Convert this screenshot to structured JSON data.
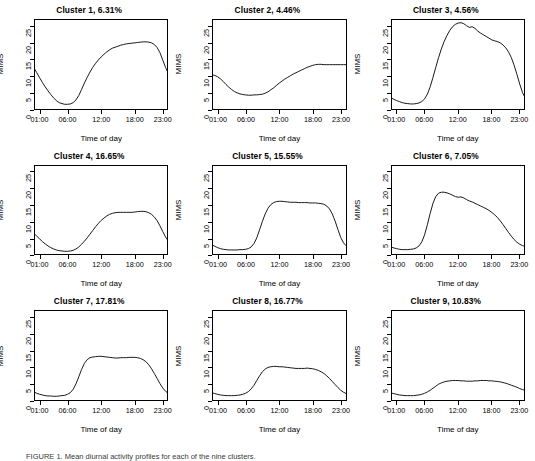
{
  "figure": {
    "axis_labels": {
      "x": "Time of day",
      "y": "MIMS"
    },
    "caption_prefix": "FIGURE 1",
    "caption_text": "FIGURE 1. Mean diurnal activity profiles for each of the nine clusters."
  },
  "chart_data": {
    "type": "line",
    "xlabel": "Time of day",
    "ylabel": "MIMS",
    "xlim": [
      0,
      24
    ],
    "ylim": [
      0,
      27
    ],
    "grid": false,
    "legend": "none",
    "xticks": [
      {
        "value": 1,
        "label": "01:00"
      },
      {
        "value": 6,
        "label": "06:00"
      },
      {
        "value": 12,
        "label": "12:00"
      },
      {
        "value": 18,
        "label": "18:00"
      },
      {
        "value": 23,
        "label": "23:00"
      }
    ],
    "yticks": [
      {
        "value": 0,
        "label": "0"
      },
      {
        "value": 5,
        "label": "5"
      },
      {
        "value": 10,
        "label": "10"
      },
      {
        "value": 15,
        "label": "15"
      },
      {
        "value": 20,
        "label": "20"
      },
      {
        "value": 25,
        "label": "25"
      }
    ],
    "x": [
      0,
      0.5,
      1,
      1.5,
      2,
      2.5,
      3,
      3.5,
      4,
      4.5,
      5,
      5.5,
      6,
      6.5,
      7,
      7.5,
      8,
      8.5,
      9,
      9.5,
      10,
      10.5,
      11,
      11.5,
      12,
      12.5,
      13,
      13.5,
      14,
      14.5,
      15,
      15.5,
      16,
      16.5,
      17,
      17.5,
      18,
      18.5,
      19,
      19.5,
      20,
      20.5,
      21,
      21.5,
      22,
      22.5,
      23,
      23.5,
      24
    ],
    "panels": [
      {
        "id": "cluster-1",
        "title": "Cluster 1, 6.31%",
        "cluster": 1,
        "percent": 6.31,
        "values": [
          12.4,
          11.0,
          9.5,
          8.1,
          6.8,
          5.6,
          4.5,
          3.5,
          2.7,
          2.1,
          1.8,
          1.6,
          1.6,
          1.7,
          2.1,
          2.9,
          4.2,
          6.0,
          7.9,
          9.6,
          11.2,
          12.6,
          13.8,
          14.8,
          15.7,
          16.5,
          17.2,
          17.8,
          18.3,
          18.6,
          18.9,
          19.2,
          19.4,
          19.6,
          19.7,
          19.8,
          19.9,
          20.0,
          20.1,
          20.2,
          20.2,
          20.1,
          19.9,
          19.4,
          18.5,
          17.0,
          14.8,
          12.6,
          10.9
        ]
      },
      {
        "id": "cluster-2",
        "title": "Cluster 2, 4.46%",
        "cluster": 2,
        "percent": 4.46,
        "values": [
          10.4,
          10.2,
          9.8,
          9.2,
          8.4,
          7.5,
          6.7,
          6.0,
          5.4,
          5.0,
          4.7,
          4.5,
          4.4,
          4.3,
          4.3,
          4.4,
          4.4,
          4.5,
          4.6,
          4.9,
          5.3,
          5.9,
          6.5,
          7.2,
          7.9,
          8.5,
          9.1,
          9.6,
          10.1,
          10.6,
          11.0,
          11.4,
          11.8,
          12.2,
          12.6,
          12.9,
          13.2,
          13.4,
          13.5,
          13.5,
          13.4,
          13.4,
          13.4,
          13.4,
          13.4,
          13.4,
          13.4,
          13.4,
          13.4
        ]
      },
      {
        "id": "cluster-3",
        "title": "Cluster 3, 4.56%",
        "cluster": 3,
        "percent": 4.56,
        "values": [
          3.5,
          3.1,
          2.7,
          2.4,
          2.1,
          1.9,
          1.8,
          1.7,
          1.7,
          1.8,
          2.0,
          2.4,
          3.2,
          4.6,
          6.8,
          9.6,
          12.6,
          15.5,
          18.1,
          20.3,
          22.1,
          23.6,
          24.7,
          25.4,
          25.8,
          25.9,
          25.6,
          25.0,
          24.5,
          24.7,
          24.2,
          23.4,
          22.8,
          22.3,
          21.8,
          21.3,
          20.8,
          20.5,
          20.3,
          19.9,
          19.3,
          18.4,
          17.2,
          15.5,
          13.2,
          10.5,
          7.6,
          5.1,
          3.4
        ]
      },
      {
        "id": "cluster-4",
        "title": "Cluster 4, 16.65%",
        "cluster": 4,
        "percent": 16.65,
        "values": [
          6.6,
          5.8,
          5.0,
          4.2,
          3.5,
          2.9,
          2.4,
          2.0,
          1.7,
          1.5,
          1.4,
          1.3,
          1.3,
          1.4,
          1.6,
          2.0,
          2.6,
          3.4,
          4.3,
          5.3,
          6.4,
          7.5,
          8.6,
          9.6,
          10.5,
          11.2,
          11.8,
          12.3,
          12.6,
          12.8,
          12.9,
          12.9,
          12.9,
          12.9,
          12.9,
          12.9,
          13.0,
          13.1,
          13.2,
          13.2,
          13.1,
          12.8,
          12.3,
          11.5,
          10.4,
          8.9,
          7.2,
          5.6,
          4.3
        ]
      },
      {
        "id": "cluster-5",
        "title": "Cluster 5, 15.55%",
        "cluster": 5,
        "percent": 15.55,
        "values": [
          3.2,
          2.8,
          2.4,
          2.1,
          1.9,
          1.8,
          1.7,
          1.7,
          1.7,
          1.7,
          1.8,
          1.8,
          1.9,
          2.1,
          2.6,
          3.6,
          5.3,
          7.7,
          10.2,
          12.4,
          14.1,
          15.2,
          15.8,
          16.1,
          16.2,
          16.2,
          16.1,
          16.0,
          15.9,
          15.9,
          15.9,
          15.8,
          15.8,
          15.8,
          15.8,
          15.7,
          15.7,
          15.7,
          15.6,
          15.5,
          15.3,
          14.8,
          13.9,
          12.4,
          10.3,
          7.8,
          5.4,
          3.8,
          2.9
        ]
      },
      {
        "id": "cluster-6",
        "title": "Cluster 6, 7.05%",
        "cluster": 6,
        "percent": 7.05,
        "values": [
          2.6,
          2.3,
          2.1,
          1.9,
          1.8,
          1.8,
          1.8,
          1.9,
          2.0,
          2.3,
          2.9,
          4.1,
          6.2,
          9.2,
          12.6,
          15.6,
          17.6,
          18.6,
          18.9,
          18.9,
          18.7,
          18.4,
          18.0,
          17.6,
          17.4,
          17.5,
          17.2,
          16.7,
          16.3,
          16.0,
          15.6,
          15.2,
          14.8,
          14.4,
          14.0,
          13.5,
          12.9,
          12.2,
          11.4,
          10.4,
          9.3,
          8.1,
          6.9,
          5.8,
          4.8,
          4.0,
          3.4,
          3.0,
          2.7
        ]
      },
      {
        "id": "cluster-7",
        "title": "Cluster 7, 17.81%",
        "cluster": 7,
        "percent": 17.81,
        "values": [
          2.6,
          2.2,
          1.9,
          1.7,
          1.5,
          1.4,
          1.4,
          1.3,
          1.3,
          1.4,
          1.5,
          1.6,
          1.9,
          2.4,
          3.4,
          5.0,
          7.1,
          9.3,
          11.1,
          12.2,
          12.8,
          13.0,
          13.1,
          13.2,
          13.2,
          13.1,
          13.0,
          12.9,
          12.8,
          12.7,
          12.7,
          12.8,
          12.8,
          12.8,
          12.9,
          12.9,
          12.9,
          12.8,
          12.6,
          12.2,
          11.6,
          10.7,
          9.5,
          8.1,
          6.6,
          5.1,
          3.8,
          2.8,
          2.2
        ]
      },
      {
        "id": "cluster-8",
        "title": "Cluster 8, 16.77%",
        "cluster": 8,
        "percent": 16.77,
        "values": [
          2.4,
          2.1,
          1.9,
          1.7,
          1.6,
          1.5,
          1.5,
          1.5,
          1.5,
          1.6,
          1.7,
          1.9,
          2.2,
          2.7,
          3.5,
          4.6,
          6.0,
          7.4,
          8.6,
          9.4,
          9.9,
          10.1,
          10.2,
          10.2,
          10.1,
          10.1,
          10.0,
          9.9,
          9.8,
          9.7,
          9.6,
          9.6,
          9.6,
          9.6,
          9.7,
          9.6,
          9.5,
          9.3,
          9.0,
          8.6,
          8.1,
          7.4,
          6.6,
          5.7,
          4.8,
          3.9,
          3.1,
          2.5,
          2.1
        ]
      },
      {
        "id": "cluster-9",
        "title": "Cluster 9, 10.83%",
        "cluster": 9,
        "percent": 10.83,
        "values": [
          2.3,
          2.1,
          1.9,
          1.7,
          1.6,
          1.5,
          1.5,
          1.5,
          1.5,
          1.6,
          1.7,
          1.9,
          2.2,
          2.6,
          3.1,
          3.7,
          4.3,
          4.9,
          5.3,
          5.6,
          5.8,
          5.9,
          6.0,
          6.0,
          6.0,
          5.9,
          5.9,
          5.8,
          5.8,
          5.8,
          5.9,
          5.9,
          6.0,
          6.0,
          6.0,
          5.9,
          5.9,
          5.8,
          5.7,
          5.6,
          5.4,
          5.2,
          4.9,
          4.6,
          4.3,
          4.0,
          3.6,
          3.3,
          3.1
        ]
      }
    ]
  }
}
